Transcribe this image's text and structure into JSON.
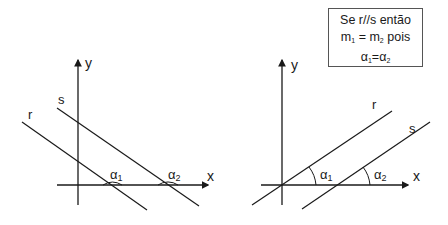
{
  "diagrams": [
    {
      "id": "left",
      "axis_labels": {
        "x": "x",
        "y": "y"
      },
      "lines": [
        {
          "name": "r",
          "label": "r"
        },
        {
          "name": "s",
          "label": "s"
        }
      ],
      "angles": [
        {
          "symbol": "α",
          "sub": "1"
        },
        {
          "symbol": "α",
          "sub": "2"
        }
      ]
    },
    {
      "id": "right",
      "axis_labels": {
        "x": "x",
        "y": "y"
      },
      "lines": [
        {
          "name": "r",
          "label": "r"
        },
        {
          "name": "s",
          "label": "s"
        }
      ],
      "angles": [
        {
          "symbol": "α",
          "sub": "1"
        },
        {
          "symbol": "α",
          "sub": "2"
        }
      ]
    }
  ],
  "note": {
    "line1": "Se r//s então",
    "line2_a": "m",
    "line2_a_sub": "1",
    "line2_mid": " = m",
    "line2_b_sub": "2",
    "line2_end": " pois",
    "line3_a": "α",
    "line3_a_sub": "1",
    "line3_eq": "=α",
    "line3_b_sub": "2"
  },
  "colors": {
    "stroke": "#1a1a1a",
    "background": "#ffffff",
    "box_border": "#555555"
  }
}
